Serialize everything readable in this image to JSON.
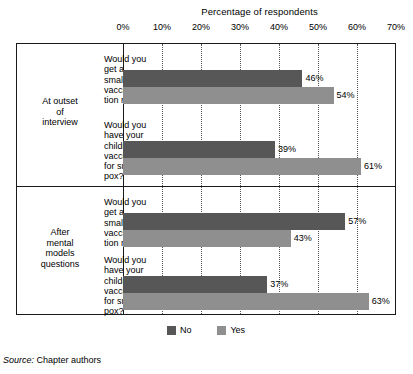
{
  "chart_data": {
    "type": "bar",
    "orientation": "horizontal",
    "title": "Percentage of respondents",
    "xlabel": "",
    "ylabel": "",
    "xlim": [
      0,
      70
    ],
    "xticks": [
      0,
      10,
      20,
      30,
      40,
      50,
      60,
      70
    ],
    "xtick_labels": [
      "0%",
      "10%",
      "20%",
      "30%",
      "40%",
      "50%",
      "60%",
      "70%"
    ],
    "grid": true,
    "grid_axis": "x",
    "legend_position": "bottom-center",
    "legend": [
      {
        "name": "No",
        "color": "#575757"
      },
      {
        "name": "Yes",
        "color": "#8f8f8f"
      }
    ],
    "panels": [
      {
        "label_lines": [
          "At outset",
          "of",
          "interview"
        ],
        "groups": [
          {
            "question_lines": [
              "Would you",
              "get a",
              "smallpox",
              "vaccina-",
              "tion now?"
            ],
            "bars": [
              {
                "series": "No",
                "value": 46,
                "label": "46%"
              },
              {
                "series": "Yes",
                "value": 54,
                "label": "54%"
              }
            ]
          },
          {
            "question_lines": [
              "Would you",
              "have your",
              "children",
              "vaccinated",
              "for small-",
              "pox?"
            ],
            "bars": [
              {
                "series": "No",
                "value": 39,
                "label": "39%"
              },
              {
                "series": "Yes",
                "value": 61,
                "label": "61%"
              }
            ]
          }
        ]
      },
      {
        "label_lines": [
          "After",
          "mental",
          "models",
          "questions"
        ],
        "groups": [
          {
            "question_lines": [
              "Would you",
              "get a",
              "smallpox",
              "vaccina-",
              "tion now?"
            ],
            "bars": [
              {
                "series": "No",
                "value": 57,
                "label": "57%"
              },
              {
                "series": "Yes",
                "value": 43,
                "label": "43%"
              }
            ]
          },
          {
            "question_lines": [
              "Would you",
              "have your",
              "children",
              "vaccinated",
              "for small-",
              "pox?"
            ],
            "bars": [
              {
                "series": "No",
                "value": 37,
                "label": "37%"
              },
              {
                "series": "Yes",
                "value": 63,
                "label": "63%"
              }
            ]
          }
        ]
      }
    ]
  },
  "source": {
    "keyword": "Source:",
    "text": "Chapter authors"
  }
}
